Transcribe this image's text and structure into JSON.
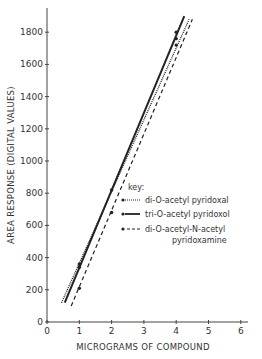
{
  "chart_data": {
    "type": "line",
    "title": "",
    "xlabel": "MICROGRAMS OF COMPOUND",
    "ylabel": "AREA RESPONSE (DIGITAL VALUES)",
    "xlim": [
      0,
      6.5
    ],
    "ylim": [
      0,
      1950
    ],
    "x_ticks": [
      0,
      1,
      2,
      3,
      4,
      5,
      6
    ],
    "y_ticks": [
      0,
      200,
      400,
      600,
      800,
      1000,
      1200,
      1400,
      1600,
      1800
    ],
    "grid": false,
    "legend_position": "center-right",
    "legend_title": "key:",
    "series": [
      {
        "name": "di-O-acetyl pyridoxal",
        "style": "dotted",
        "points": [
          {
            "x": 1.0,
            "y": 360
          },
          {
            "x": 4.0,
            "y": 1760
          }
        ],
        "line": {
          "x0": 0.45,
          "y0": 120,
          "x1": 4.4,
          "y1": 1880
        }
      },
      {
        "name": "tri-O-acetyl pyridoxol",
        "style": "solid",
        "points": [
          {
            "x": 1.0,
            "y": 340
          },
          {
            "x": 2.0,
            "y": 820
          },
          {
            "x": 4.0,
            "y": 1800
          }
        ],
        "line": {
          "x0": 0.55,
          "y0": 120,
          "x1": 4.25,
          "y1": 1900
        }
      },
      {
        "name": "di-O-acetyl-N-acetyl pyridoxamine",
        "style": "dashed",
        "points": [
          {
            "x": 1.0,
            "y": 210
          },
          {
            "x": 2.0,
            "y": 680
          },
          {
            "x": 4.0,
            "y": 1720
          }
        ],
        "line": {
          "x0": 0.75,
          "y0": 100,
          "x1": 4.5,
          "y1": 1880
        }
      }
    ]
  },
  "axes": {
    "x_label": "MICROGRAMS OF COMPOUND",
    "y_label": "AREA RESPONSE (DIGITAL VALUES)",
    "x_tick_labels": [
      "0",
      "1",
      "2",
      "3",
      "4",
      "5",
      "6"
    ],
    "y_tick_labels": [
      "0",
      "200",
      "400",
      "600",
      "800",
      "1000",
      "1200",
      "1400",
      "1600",
      "1800"
    ]
  },
  "legend": {
    "title": "key:",
    "items": [
      {
        "label": "di-O-acetyl pyridoxal",
        "style": "dotted"
      },
      {
        "label": "tri-O-acetyl pyridoxol",
        "style": "solid"
      },
      {
        "label_line1": "di-O-acetyl-N-acetyl",
        "label_line2": "pyridoxamine",
        "style": "dashed"
      }
    ]
  }
}
